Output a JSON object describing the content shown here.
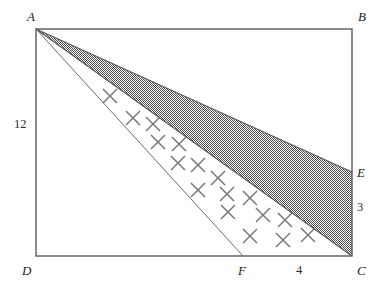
{
  "figure": {
    "background_color": "#ffffff",
    "stroke_color": "#595959",
    "shade_color": "#808080",
    "cross_color": "#777777",
    "rectangle": {
      "left": 36,
      "top": 29,
      "right": 352,
      "bottom": 256
    },
    "points": {
      "A": {
        "x": 36,
        "y": 29
      },
      "B": {
        "x": 352,
        "y": 29
      },
      "C": {
        "x": 352,
        "y": 256
      },
      "D": {
        "x": 36,
        "y": 256
      },
      "E": {
        "x": 352,
        "y": 172
      },
      "F": {
        "x": 243,
        "y": 256
      }
    },
    "vertex_labels": [
      {
        "name": "label-A",
        "text": "A",
        "x": 27,
        "y": 10
      },
      {
        "name": "label-B",
        "text": "B",
        "x": 358,
        "y": 10
      },
      {
        "name": "label-C",
        "text": "C",
        "x": 357,
        "y": 264
      },
      {
        "name": "label-D",
        "text": "D",
        "x": 22,
        "y": 264
      },
      {
        "name": "label-E",
        "text": "E",
        "x": 357,
        "y": 166
      },
      {
        "name": "label-F",
        "text": "F",
        "x": 238,
        "y": 264
      }
    ],
    "measure_labels": [
      {
        "name": "measure-AD",
        "text": "12",
        "x": 14,
        "y": 118
      },
      {
        "name": "measure-EC",
        "text": "3",
        "x": 357,
        "y": 201
      },
      {
        "name": "measure-FC",
        "text": "4",
        "x": 296,
        "y": 264
      }
    ],
    "shaded_region": {
      "name": "shaded-triangle-AEC",
      "vertices": "36,29 352,172 352,256"
    },
    "cross_band": {
      "name": "cross-hatched-region-AFC",
      "vertices": "36,29 243,256 352,256"
    },
    "lines": [
      {
        "name": "line-AE",
        "x1": 36,
        "y1": 29,
        "x2": 352,
        "y2": 172
      },
      {
        "name": "line-AC",
        "x1": 36,
        "y1": 29,
        "x2": 352,
        "y2": 256
      },
      {
        "name": "line-AF",
        "x1": 36,
        "y1": 29,
        "x2": 243,
        "y2": 256
      }
    ],
    "crosses": [
      {
        "x": 110,
        "y": 96
      },
      {
        "x": 133,
        "y": 118
      },
      {
        "x": 153,
        "y": 124
      },
      {
        "x": 158,
        "y": 142
      },
      {
        "x": 179,
        "y": 144
      },
      {
        "x": 178,
        "y": 163
      },
      {
        "x": 198,
        "y": 165
      },
      {
        "x": 218,
        "y": 178
      },
      {
        "x": 198,
        "y": 190
      },
      {
        "x": 227,
        "y": 194
      },
      {
        "x": 250,
        "y": 198
      },
      {
        "x": 228,
        "y": 212
      },
      {
        "x": 263,
        "y": 215
      },
      {
        "x": 285,
        "y": 220
      },
      {
        "x": 250,
        "y": 236
      },
      {
        "x": 283,
        "y": 240
      },
      {
        "x": 308,
        "y": 235
      }
    ]
  }
}
